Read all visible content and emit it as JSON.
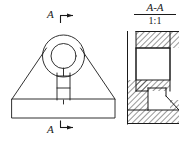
{
  "drawing": {
    "type": "mechanical-engineering-drawing",
    "sheet": {
      "width": 179,
      "height": 144,
      "background": "#ffffff"
    },
    "line_color": "#1a1a1a",
    "hatch_color": "#1a1a1a"
  },
  "front_view": {
    "name": "front-view",
    "description": "Bracket front view: trapezoidal body with circular boss and central slot on rectangular base",
    "base_plate": {
      "x": 12,
      "y": 99,
      "width": 103,
      "height": 19
    },
    "trapezoid": {
      "left_x": 12,
      "right_x": 115,
      "bottom_y": 99,
      "apex_left_x": 44,
      "apex_right_x": 83,
      "top_y": 55
    },
    "boss_outer_circle": {
      "cx": 63.5,
      "cy": 56,
      "r": 21
    },
    "boss_inner_circle": {
      "cx": 63.5,
      "cy": 56,
      "r": 12.5
    },
    "slot": {
      "x": 57,
      "y": 73,
      "width": 13,
      "height": 27
    },
    "slot_divider_y": 86,
    "center_line_x": 63.5
  },
  "section_marks": {
    "top": {
      "letter": "A",
      "name": "section-mark-a-top",
      "arrow_direction": "down",
      "leader": {
        "x1": 60,
        "y1": 15,
        "x2": 73,
        "y2": 15
      },
      "tick": {
        "x": 60,
        "y1": 15,
        "y2": 23
      }
    },
    "bottom": {
      "letter": "A",
      "name": "section-mark-a-bottom",
      "arrow_direction": "up",
      "leader": {
        "x1": 60,
        "y1": 128,
        "x2": 73,
        "y2": 128
      },
      "tick": {
        "x": 60,
        "y1": 121,
        "y2": 128
      }
    }
  },
  "section_view": {
    "name": "section-view-a-a",
    "title": "A-A",
    "scale": "1:1",
    "description": "Sectional view A-A with cross hatching showing bore cavity and stepped notch",
    "outline": {
      "left_x": 127,
      "right_x": 179,
      "top_y": 31,
      "bottom_y": 124
    },
    "cavity": {
      "x": 136,
      "y": 48,
      "width": 34,
      "height": 32
    },
    "notch": {
      "x": 148,
      "y": 88,
      "width": 31,
      "height": 22
    },
    "hatch_bands": [
      {
        "name": "top-flange",
        "x": 136,
        "y": 31,
        "width": 34,
        "height": 17
      },
      {
        "name": "mid-flange",
        "x": 136,
        "y": 80,
        "width": 34,
        "height": 11
      },
      {
        "name": "left-web",
        "x": 127,
        "y": 80,
        "width": 21,
        "height": 30
      },
      {
        "name": "bottom-plate",
        "x": 127,
        "y": 110,
        "width": 52,
        "height": 14
      },
      {
        "name": "right-lower",
        "x": 170,
        "y": 100,
        "width": 9,
        "height": 10
      }
    ],
    "hatch_angle_deg": 45,
    "hatch_spacing_px": 4
  }
}
